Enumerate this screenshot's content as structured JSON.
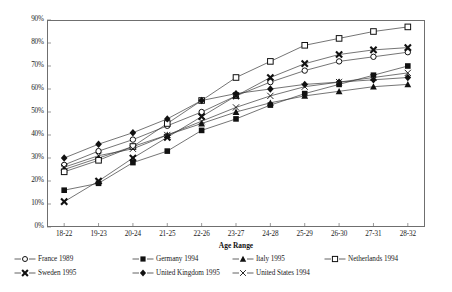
{
  "chart_data": {
    "type": "line",
    "title": "",
    "xlabel": "Age Range",
    "ylabel": "",
    "categories": [
      "18-22",
      "19-23",
      "20-24",
      "21-25",
      "22-26",
      "23-27",
      "24-28",
      "25-29",
      "26-30",
      "27-31",
      "28-32"
    ],
    "ylim": [
      0,
      90
    ],
    "ytick_labels": [
      "0%",
      "10%",
      "20%",
      "30%",
      "40%",
      "50%",
      "60%",
      "70%",
      "80%",
      "90%"
    ],
    "ytick_values": [
      0,
      10,
      20,
      30,
      40,
      50,
      60,
      70,
      80,
      90
    ],
    "grid": false,
    "legend_position": "bottom",
    "series": [
      {
        "name": "France 1989",
        "marker": "open-circle",
        "values": [
          27,
          33,
          38,
          44,
          50,
          57,
          63,
          68,
          72,
          74,
          76
        ]
      },
      {
        "name": "Germany 1994",
        "marker": "filled-square",
        "values": [
          16,
          19,
          28,
          33,
          42,
          47,
          53,
          58,
          62,
          66,
          70
        ]
      },
      {
        "name": "Italy 1995",
        "marker": "filled-triangle",
        "values": [
          25,
          30,
          35,
          40,
          45,
          50,
          54,
          57,
          59,
          61,
          62
        ]
      },
      {
        "name": "Netherlands 1994",
        "marker": "open-square",
        "values": [
          24,
          29,
          35,
          45,
          55,
          65,
          72,
          79,
          82,
          85,
          87
        ]
      },
      {
        "name": "Sweden 1995",
        "marker": "bold-cross",
        "values": [
          11,
          20,
          30,
          39,
          48,
          57,
          65,
          71,
          75,
          77,
          78
        ]
      },
      {
        "name": "United Kingdom 1995",
        "marker": "filled-diamond",
        "values": [
          30,
          36,
          41,
          47,
          55,
          58,
          60,
          62,
          63,
          64,
          65
        ]
      },
      {
        "name": "United States 1994",
        "marker": "thin-cross",
        "values": [
          26,
          31,
          34,
          40,
          46,
          52,
          57,
          61,
          63,
          65,
          67
        ]
      }
    ]
  },
  "axis": {
    "x_title": "Age Range"
  }
}
